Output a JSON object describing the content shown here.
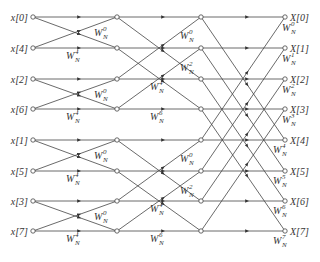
{
  "diagram": {
    "inputs": [
      "x[0]",
      "x[4]",
      "x[2]",
      "x[6]",
      "x[1]",
      "x[5]",
      "x[3]",
      "x[7]"
    ],
    "outputs": [
      "X[0]",
      "X[1]",
      "X[2]",
      "X[3]",
      "X[4]",
      "X[5]",
      "X[6]",
      "X[7]"
    ],
    "twiddle_base": "W",
    "twiddle_sub": "N",
    "stage1_twiddles": [
      "0",
      "4",
      "0",
      "4",
      "0",
      "4",
      "0",
      "4"
    ],
    "stage2_twiddles": [
      "0",
      "2",
      "4",
      "6",
      "0",
      "2",
      "4",
      "6"
    ],
    "stage3_twiddles": [
      "0",
      "1",
      "2",
      "3",
      "4",
      "5",
      "6",
      "7"
    ],
    "colors": {
      "line": "#444444",
      "text": "#333333",
      "background": "#ffffff"
    }
  }
}
